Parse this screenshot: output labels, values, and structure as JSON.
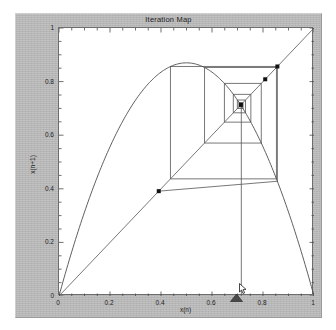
{
  "figure": {
    "title": "Iteration Map",
    "bg_color": "#b9b9b9",
    "plot_bg_color": "#ffffff",
    "frame_color": "#6d6d6d"
  },
  "axes": {
    "x": {
      "label": "x(n)",
      "ticks": [
        "0",
        "0.2",
        "0.4",
        "0.6",
        "0.8",
        "1"
      ],
      "tick_values": [
        0,
        0.2,
        0.4,
        0.6,
        0.8,
        1
      ],
      "range": [
        0,
        1
      ]
    },
    "y": {
      "label": "x(n+1)",
      "ticks": [
        "0",
        "0.2",
        "0.4",
        "0.6",
        "0.8",
        "1"
      ],
      "tick_values": [
        0,
        0.2,
        0.4,
        0.6,
        0.8,
        1
      ],
      "range": [
        0,
        1
      ]
    }
  },
  "controls": {
    "slider": {
      "name": "parameter-slider",
      "value": 0.7,
      "color": "#3a3a3a"
    },
    "cursor": {
      "name": "mouse-cursor",
      "x": 0.715,
      "y": 1.0
    }
  },
  "chart_data": {
    "type": "line",
    "title": "Iteration Map",
    "xlabel": "x(n)",
    "ylabel": "x(n+1)",
    "xlim": [
      0,
      1
    ],
    "ylim": [
      0,
      1
    ],
    "grid": false,
    "legend": false,
    "series": [
      {
        "name": "map-curve",
        "type": "line",
        "comment": "logistic map f(x) = r*x*(1-x), r = 3.48",
        "r": 3.48,
        "x": [
          0,
          0.05,
          0.1,
          0.15,
          0.2,
          0.25,
          0.3,
          0.35,
          0.4,
          0.45,
          0.5,
          0.55,
          0.6,
          0.65,
          0.7,
          0.75,
          0.8,
          0.85,
          0.9,
          0.95,
          1.0
        ],
        "y": [
          0,
          0.1653,
          0.3132,
          0.4437,
          0.5568,
          0.6525,
          0.7308,
          0.7917,
          0.8352,
          0.8613,
          0.87,
          0.8613,
          0.8352,
          0.7917,
          0.7308,
          0.6525,
          0.5568,
          0.4437,
          0.3132,
          0.1653,
          0
        ]
      },
      {
        "name": "diagonal",
        "type": "line",
        "comment": "y = x reference line",
        "x": [
          0,
          1
        ],
        "y": [
          0,
          1
        ]
      },
      {
        "name": "cobweb",
        "type": "line",
        "comment": "staircase/cobweb iteration spiralling inward to the fixed point",
        "points": [
          [
            0.715,
            0.0
          ],
          [
            0.715,
            0.7101
          ],
          [
            0.7101,
            0.7101
          ],
          [
            0.7101,
            0.7165
          ],
          [
            0.7165,
            0.7165
          ],
          [
            0.7165,
            0.7085
          ],
          [
            0.7085,
            0.7085
          ],
          [
            0.7085,
            0.7185
          ],
          [
            0.7185,
            0.7185
          ],
          [
            0.7185,
            0.7058
          ],
          [
            0.7058,
            0.7058
          ],
          [
            0.7058,
            0.7219
          ],
          [
            0.7219,
            0.7219
          ],
          [
            0.7219,
            0.6995
          ],
          [
            0.6995,
            0.6995
          ],
          [
            0.6995,
            0.7313
          ],
          [
            0.7313,
            0.7313
          ],
          [
            0.7313,
            0.6836
          ],
          [
            0.6836,
            0.6836
          ],
          [
            0.6836,
            0.7524
          ],
          [
            0.7524,
            0.7524
          ],
          [
            0.7524,
            0.6487
          ],
          [
            0.6487,
            0.6487
          ],
          [
            0.6487,
            0.7932
          ],
          [
            0.7932,
            0.7932
          ],
          [
            0.7932,
            0.5707
          ],
          [
            0.5707,
            0.5707
          ],
          [
            0.5707,
            0.8527
          ],
          [
            0.8527,
            0.8527
          ],
          [
            0.8527,
            0.4371
          ],
          [
            0.4371,
            0.4371
          ],
          [
            0.4371,
            0.8564
          ],
          [
            0.8564,
            0.8564
          ],
          [
            0.8564,
            0.4281
          ],
          [
            0.3912,
            0.3912
          ]
        ]
      }
    ],
    "markers": [
      {
        "x": 0.3912,
        "y": 0.3912
      },
      {
        "x": 0.8564,
        "y": 0.8564
      },
      {
        "x": 0.8087,
        "y": 0.8087
      },
      {
        "x": 0.7132,
        "y": 0.7132
      }
    ]
  }
}
